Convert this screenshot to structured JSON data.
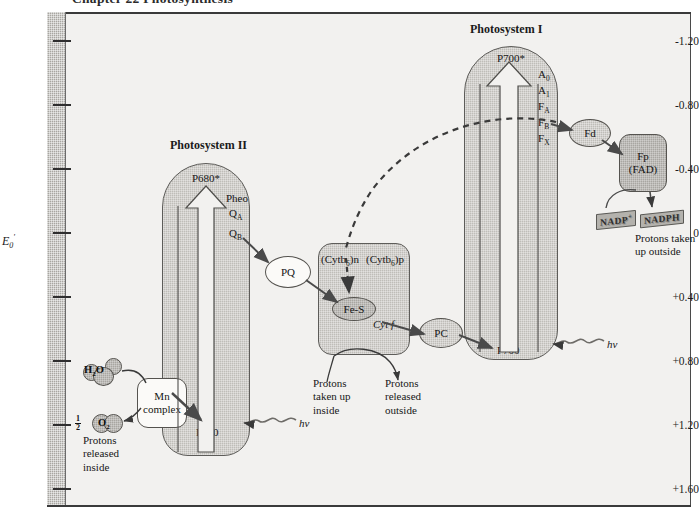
{
  "page": {
    "chapter_title": "Chapter 22  Photosynthesis"
  },
  "axis": {
    "title_E": "E",
    "title_sub": "0",
    "title_sup": "'",
    "ticks": [
      "-1.20",
      "-0.80",
      "-0.40",
      "0",
      "+0.40",
      "+0.80",
      "+1.20",
      "+1.60"
    ],
    "range_top": -1.4,
    "range_bottom": 1.7
  },
  "photosystem2": {
    "title": "Photosystem II",
    "top_label": "P680*",
    "carriers": [
      "Pheo",
      "Q",
      "Q"
    ],
    "carrier_a_sub": "A",
    "carrier_b_sub": "B",
    "bottom_label": "P680",
    "donor_label": "D",
    "photon_label": "hv"
  },
  "photosystem1": {
    "title": "Photosystem I",
    "top_label": "P700*",
    "carriers": [
      {
        "name": "A",
        "sub": "0"
      },
      {
        "name": "A",
        "sub": "1"
      },
      {
        "name": "F",
        "sub": "A"
      },
      {
        "name": "F",
        "sub": "B"
      },
      {
        "name": "F",
        "sub": "X"
      }
    ],
    "bottom_label": "P700",
    "photon_label": "hv"
  },
  "cytochrome_complex": {
    "label_n": "(Cytb",
    "label_n_sub": "6",
    "label_n_end": ")n",
    "label_p": "(Cytb",
    "label_p_sub": "6",
    "label_p_end": ")p",
    "fes_label": "Fe-S",
    "cytf_label": "Cyt f"
  },
  "carriers_mobile": {
    "pq": "PQ",
    "pc": "PC",
    "fd": "Fd",
    "fp_line1": "Fp",
    "fp_line2": "(FAD)"
  },
  "water_splitting": {
    "water_label": "H",
    "water_sub": "2",
    "water_end": "O",
    "oxygen_num": "1",
    "oxygen_den": "2",
    "oxygen_label": "O",
    "oxygen_sub": "2",
    "mn_line1": "Mn",
    "mn_line2": "complex",
    "protons_line1": "Protons",
    "protons_line2": "released",
    "protons_line3": "inside"
  },
  "proton_notes": {
    "taken_up_line1": "Protons",
    "taken_up_line2": "taken up",
    "taken_up_line3": "inside",
    "released_line1": "Protons",
    "released_line2": "released",
    "released_line3": "outside",
    "outside_line1": "Protons taken",
    "outside_line2": "up outside"
  },
  "nadp": {
    "oxidized": "NADP",
    "oxidized_charge": "+",
    "reduced": "NADPH"
  },
  "colors": {
    "shade_light": "#bfbdb8",
    "shade_dark": "#a8a6a1",
    "bg": "#f2f1ef",
    "stroke": "#55534f",
    "axis_gray": "#b9b7b2"
  }
}
